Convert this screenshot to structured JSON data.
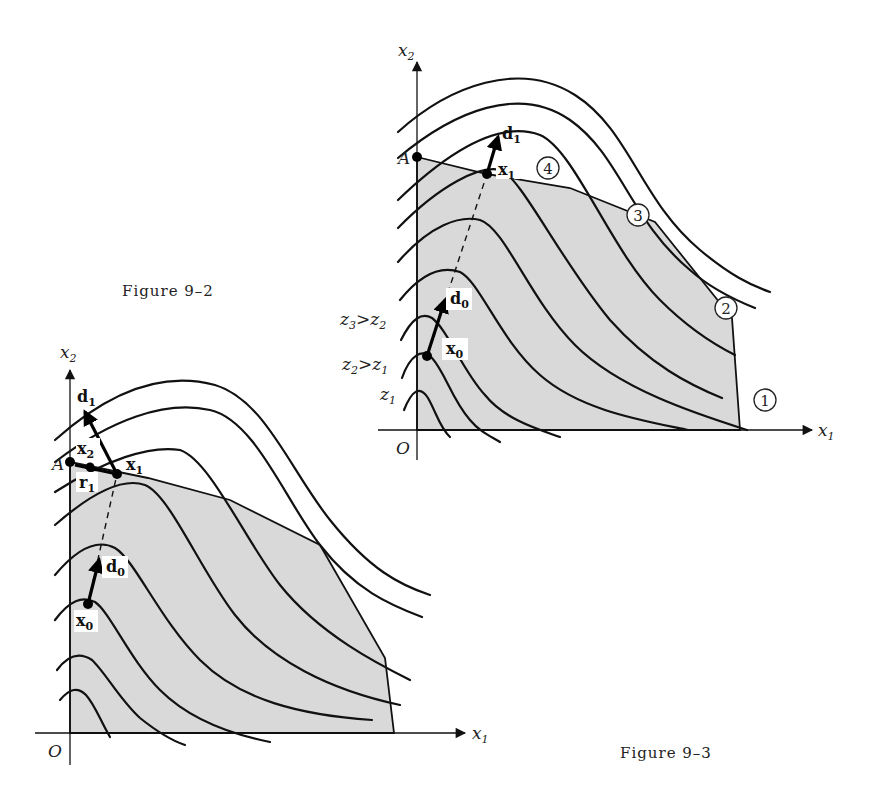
{
  "figure_left": {
    "caption": "Figure 9–2",
    "axes": {
      "x": "x",
      "x_sub": "1",
      "y": "x",
      "y_sub": "2",
      "origin": "O"
    },
    "points": {
      "A": "A",
      "x0": "x",
      "x0_sub": "0",
      "x1": "x",
      "x1_sub": "1",
      "x2": "x",
      "x2_sub": "2"
    },
    "vectors": {
      "d0": "d",
      "d0_sub": "0",
      "d1": "d",
      "d1_sub": "1",
      "r1": "r",
      "r1_sub": "1"
    }
  },
  "figure_right": {
    "caption": "Figure 9–3",
    "axes": {
      "x": "x",
      "x_sub": "1",
      "y": "x",
      "y_sub": "2",
      "origin": "O"
    },
    "points": {
      "A": "A",
      "x0": "x",
      "x0_sub": "0",
      "x1": "x",
      "x1_sub": "1"
    },
    "vectors": {
      "d0": "d",
      "d0_sub": "0",
      "d1": "d",
      "d1_sub": "1"
    },
    "contour_labels": {
      "z1": "z",
      "z1_sub": "1",
      "z2_gt_z1": {
        "a": "z",
        "a_sub": "2",
        "op": ">",
        "b": "z",
        "b_sub": "1"
      },
      "z3_gt_z2": {
        "a": "z",
        "a_sub": "3",
        "op": ">",
        "b": "z",
        "b_sub": "2"
      }
    },
    "constraint_markers": [
      "1",
      "2",
      "3",
      "4"
    ]
  }
}
